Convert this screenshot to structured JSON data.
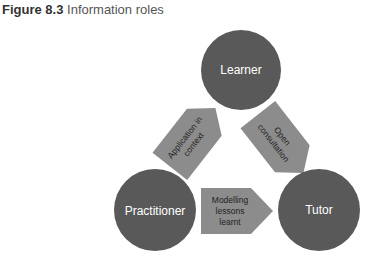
{
  "caption": {
    "label": "Figure 8.3",
    "title": "Information roles"
  },
  "nodes": {
    "learner": "Learner",
    "practitioner": "Practitioner",
    "tutor": "Tutor"
  },
  "arrows": {
    "left": [
      "Application in",
      "context"
    ],
    "right": [
      "Open",
      "consultation"
    ],
    "bottom": [
      "Modelling",
      "lessons",
      "learnt"
    ]
  },
  "colors": {
    "circle": "#595959",
    "arrow": "#8c8c8c",
    "text_light": "#ffffff",
    "text_dark": "#222222"
  }
}
